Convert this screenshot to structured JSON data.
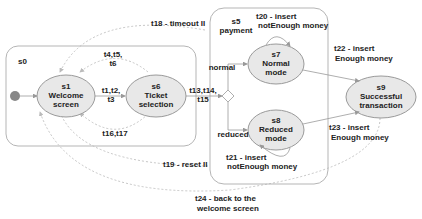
{
  "diagram": {
    "type": "state-machine",
    "regions": {
      "s0": {
        "label": "s0"
      },
      "s5": {
        "label1": "s5",
        "label2": "payment"
      }
    },
    "states": {
      "s1": {
        "id": "s1",
        "line1": "Welcome",
        "line2": "screen"
      },
      "s6": {
        "id": "s6",
        "line1": "Ticket",
        "line2": "selection"
      },
      "s7": {
        "id": "s7",
        "line1": "Normal",
        "line2": "mode"
      },
      "s8": {
        "id": "s8",
        "line1": "Reduced",
        "line2": "mode"
      },
      "s9": {
        "id": "s9",
        "line1": "Successful",
        "line2": "transaction"
      }
    },
    "choice_labels": {
      "normal": "normal",
      "reduced": "reduced"
    },
    "transitions": {
      "t1_t3": {
        "line1": "t1,t2,",
        "line2": "t3"
      },
      "t4_t6": {
        "line1": "t4,t5,",
        "line2": "t6"
      },
      "t13_t15": {
        "line1": "t13,t14,",
        "line2": "t15"
      },
      "t16_t17": {
        "line1": "t16,t17"
      },
      "t18": {
        "line1": "t18 - timeout II"
      },
      "t19": {
        "line1": "t19 - reset II"
      },
      "t20": {
        "line1": "t20 - insert",
        "line2": "notEnough money"
      },
      "t21": {
        "line1": "t21 - insert",
        "line2": "notEnough money"
      },
      "t22": {
        "line1": "t22 - insert",
        "line2": "Enough money"
      },
      "t23": {
        "line1": "t23 - insert",
        "line2": "Enough money"
      },
      "t24": {
        "line1": "t24 - back to the",
        "line2": "welcome screen"
      }
    }
  }
}
